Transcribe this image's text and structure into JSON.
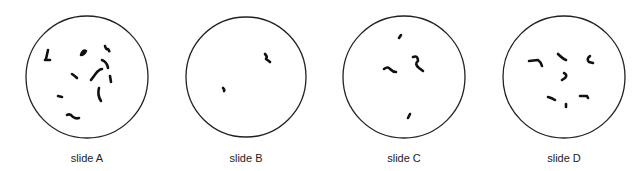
{
  "figure": {
    "stroke_color": "#222222",
    "chromosome_color": "#111111",
    "slides": [
      {
        "label": "slide A",
        "cx": 87,
        "cy": 77,
        "r": 61,
        "chromosomes": [
          "M 46 59 L 48 50",
          "M 45 60 L 50 60",
          "M 81 55 Q 83 49 86 51 Q 84 55 81 55",
          "M 105 46 Q 106 50 108 49 Q 110 52 109 51",
          "M 102 60 Q 107 62 108 68",
          "M 91 80 L 97 72 Q 100 69 102 69",
          "M 110 76 L 111 82",
          "M 72 74 Q 75 76 77 78",
          "M 99 88 Q 97 95 101 101",
          "M 58 96 L 62 97",
          "M 67 115 Q 70 113 73 117 Q 76 119 79 118"
        ]
      },
      {
        "label": "slide B",
        "cx": 246,
        "cy": 77,
        "r": 60,
        "chromosomes": [
          "M 265 54 Q 268 57 266 59 Q 269 61 270 62",
          "M 223 88 Q 225 90 224 91"
        ]
      },
      {
        "label": "slide C",
        "cx": 404,
        "cy": 77,
        "r": 61,
        "chromosomes": [
          "M 399 38 L 401 35",
          "M 384 69 Q 388 66 390 69 Q 393 72 396 72",
          "M 413 57 Q 418 55 418 61 Q 414 64 419 68 L 423 71",
          "M 408 118 L 410 114"
        ]
      },
      {
        "label": "slide D",
        "cx": 564,
        "cy": 77,
        "r": 61,
        "chromosomes": [
          "M 529 61 L 538 60 Q 541 62 542 66",
          "M 558 54 Q 563 59 566 60",
          "M 590 56 Q 586 59 589 62 L 593 63",
          "M 564 73 Q 568 75 565 78 L 562 80",
          "M 548 97 Q 552 98 555 100",
          "M 580 96 L 587 96 L 588 98",
          "M 566 104 L 566 107"
        ]
      }
    ]
  }
}
